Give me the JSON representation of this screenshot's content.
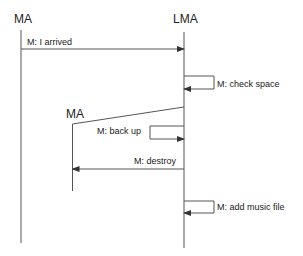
{
  "diagram": {
    "type": "sequence",
    "lifelines": [
      {
        "id": "ma",
        "label": "MA"
      },
      {
        "id": "lma",
        "label": "LMA"
      },
      {
        "id": "ma2",
        "label": "MA"
      }
    ],
    "messages": [
      {
        "from": "ma",
        "to": "lma",
        "label": "M: I arrived"
      },
      {
        "from": "lma",
        "to": "lma",
        "label": "M: check space"
      },
      {
        "from": "lma",
        "to": "ma2",
        "label": "create"
      },
      {
        "from": "lma",
        "to": "lma",
        "label": "M: back up"
      },
      {
        "from": "lma",
        "to": "ma2",
        "label": "M: destroy"
      },
      {
        "from": "lma",
        "to": "lma",
        "label": "M: add music file"
      }
    ]
  },
  "colors": {
    "line": "#555555",
    "text": "#222222",
    "background": "#ffffff"
  }
}
